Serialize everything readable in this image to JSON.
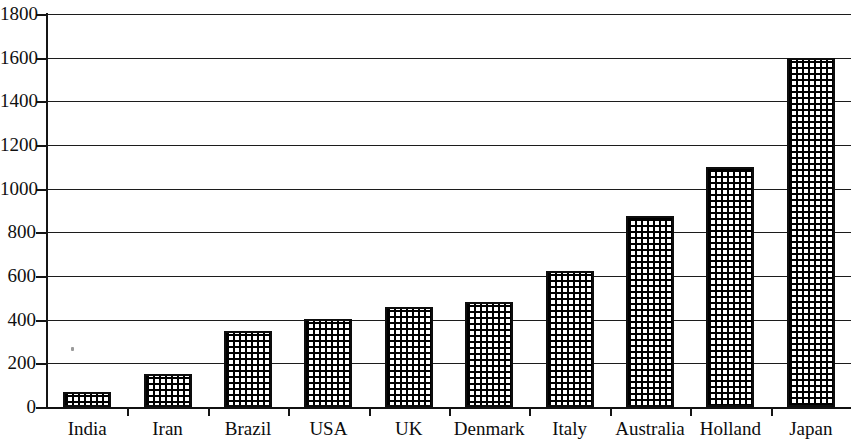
{
  "chart_data": {
    "type": "bar",
    "title": "",
    "subtitle": "",
    "xlabel": "",
    "ylabel": "",
    "categories": [
      "India",
      "Iran",
      "Brazil",
      "USA",
      "UK",
      "Denmark",
      "Italy",
      "Australia",
      "Holland",
      "Japan"
    ],
    "values": [
      70,
      150,
      350,
      405,
      460,
      480,
      625,
      875,
      1100,
      1600
    ],
    "ylim": [
      0,
      1800
    ],
    "y_ticks": [
      0,
      200,
      400,
      600,
      800,
      1000,
      1200,
      1400,
      1600,
      1800
    ],
    "y_tick_labels": [
      "0",
      "200",
      "400",
      "600",
      "800",
      "1000",
      "1200",
      "1400",
      "1600",
      "1800"
    ],
    "grid": true,
    "grid_axis": "y",
    "legend": null,
    "legend_position": "none",
    "bar_fill": "black-crosshatch",
    "bar_edge_color": "#000000",
    "axis_color": "#000000",
    "background": "#ffffff"
  },
  "axes": {
    "y": {
      "ticks": [
        {
          "label": "1800",
          "value": 1800
        },
        {
          "label": "1600",
          "value": 1600
        },
        {
          "label": "1400",
          "value": 1400
        },
        {
          "label": "1200",
          "value": 1200
        },
        {
          "label": "1000",
          "value": 1000
        },
        {
          "label": "800",
          "value": 800
        },
        {
          "label": "600",
          "value": 600
        },
        {
          "label": "400",
          "value": 400
        },
        {
          "label": "200",
          "value": 200
        },
        {
          "label": "0",
          "value": 0
        }
      ]
    },
    "x": {
      "ticks": [
        {
          "label": "India",
          "value": 70
        },
        {
          "label": "Iran",
          "value": 150
        },
        {
          "label": "Brazil",
          "value": 350
        },
        {
          "label": "USA",
          "value": 405
        },
        {
          "label": "UK",
          "value": 460
        },
        {
          "label": "Denmark",
          "value": 480
        },
        {
          "label": "Italy",
          "value": 625
        },
        {
          "label": "Australia",
          "value": 875
        },
        {
          "label": "Holland",
          "value": 1100
        },
        {
          "label": "Japan",
          "value": 1600
        }
      ]
    }
  }
}
